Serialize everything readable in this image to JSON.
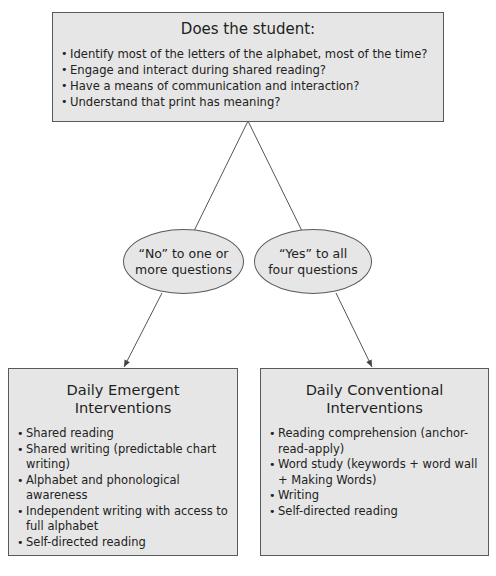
{
  "question_box": {
    "title": "Does the student:",
    "items": [
      "Identify most of the letters of the alphabet, most of the time?",
      "Engage and interact during shared reading?",
      "Have a means of communication and interaction?",
      "Understand that print has meaning?"
    ]
  },
  "decisions": {
    "no": "“No” to one or more questions",
    "yes": "“Yes” to all four questions"
  },
  "emergent_box": {
    "title": "Daily Emergent Interventions",
    "items": [
      "Shared reading",
      "Shared writing (predictable chart writing)",
      "Alphabet and phonological awareness",
      "Independent writing with access to full alphabet",
      "Self-directed reading"
    ]
  },
  "conventional_box": {
    "title": "Daily Conventional Interventions",
    "items": [
      "Reading comprehension (anchor-read-apply)",
      "Word study (keywords + word wall + Making Words)",
      "Writing",
      "Self-directed reading"
    ]
  },
  "colors": {
    "box_fill": "#e6e6e6",
    "border": "#5a5a5a",
    "text": "#222222"
  }
}
